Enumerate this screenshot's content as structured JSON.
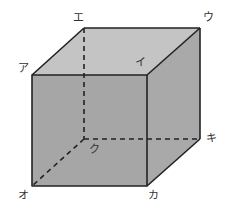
{
  "diagram": {
    "type": "cube",
    "colors": {
      "top_face": "#c4c4c4",
      "front_face": "#a6a6a6",
      "right_face": "#a9a9a9",
      "edge": "#222222",
      "hidden_edge": "#222222"
    },
    "vertices": [
      {
        "id": "a",
        "label": "ア",
        "x": 32,
        "y": 75,
        "label_x": 18,
        "label_y": 63
      },
      {
        "id": "i",
        "label": "イ",
        "x": 147,
        "y": 75,
        "label_x": 135,
        "label_y": 57
      },
      {
        "id": "u",
        "label": "ウ",
        "x": 200,
        "y": 28,
        "label_x": 203,
        "label_y": 12
      },
      {
        "id": "e",
        "label": "エ",
        "x": 84,
        "y": 28,
        "label_x": 73,
        "label_y": 12
      },
      {
        "id": "o",
        "label": "オ",
        "x": 32,
        "y": 186,
        "label_x": 18,
        "label_y": 190
      },
      {
        "id": "ka",
        "label": "カ",
        "x": 147,
        "y": 186,
        "label_x": 148,
        "label_y": 190
      },
      {
        "id": "ki",
        "label": "キ",
        "x": 200,
        "y": 139,
        "label_x": 206,
        "label_y": 133
      },
      {
        "id": "ku",
        "label": "ク",
        "x": 84,
        "y": 139,
        "label_x": 89,
        "label_y": 144
      }
    ],
    "hidden_edges": [
      "エ-ク",
      "ク-オ",
      "ク-キ"
    ]
  }
}
